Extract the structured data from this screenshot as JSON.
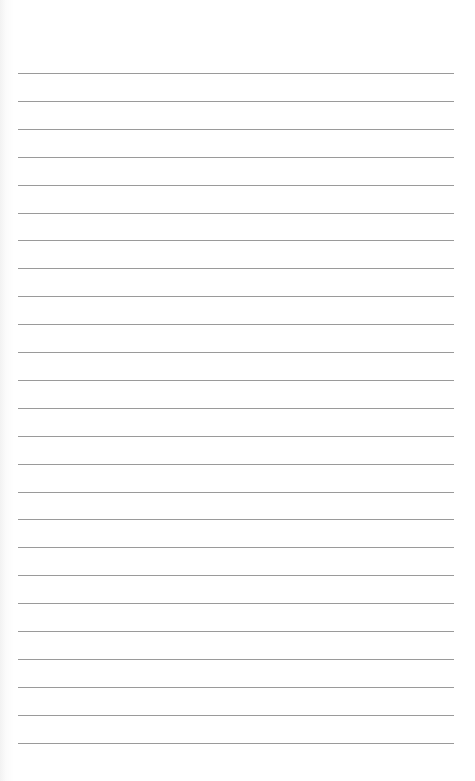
{
  "paper": {
    "type": "lined-sheet",
    "background_color": "#ffffff",
    "line_color": "#9a9a9a",
    "line_count": 25,
    "first_line_y": 73,
    "line_spacing": 27.9,
    "line_left": 18,
    "line_right": 454
  }
}
